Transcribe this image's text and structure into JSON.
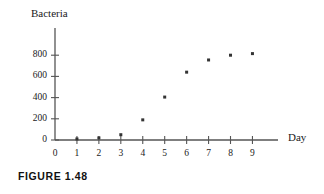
{
  "figure": {
    "caption": "FIGURE 1.48"
  },
  "chart_data": {
    "type": "scatter",
    "title": "",
    "subtitle": "",
    "xlabel": "Day",
    "ylabel": "Bacteria",
    "x": [
      0,
      1,
      2,
      3,
      4,
      5,
      6,
      7,
      8,
      9
    ],
    "values": [
      0,
      10,
      20,
      50,
      190,
      405,
      640,
      755,
      800,
      815
    ],
    "series": [
      {
        "name": "Bacteria",
        "x": [
          0,
          1,
          2,
          3,
          4,
          5,
          6,
          7,
          8,
          9
        ],
        "values": [
          0,
          10,
          20,
          50,
          190,
          405,
          640,
          755,
          800,
          815
        ]
      }
    ],
    "xticks": [
      0,
      1,
      2,
      3,
      4,
      5,
      6,
      7,
      8,
      9
    ],
    "xtick_labels": [
      "0",
      "1",
      "2",
      "3",
      "4",
      "5",
      "6",
      "7",
      "8",
      "9"
    ],
    "yticks": [
      0,
      200,
      400,
      600,
      800
    ],
    "ytick_labels": [
      "0",
      "200",
      "400",
      "600",
      "800"
    ],
    "xlim": [
      0,
      9.8
    ],
    "ylim": [
      0,
      1000
    ],
    "grid": false,
    "legend": false,
    "marker": "square-dot",
    "marker_color": "#333333",
    "axis_color": "#555555"
  }
}
